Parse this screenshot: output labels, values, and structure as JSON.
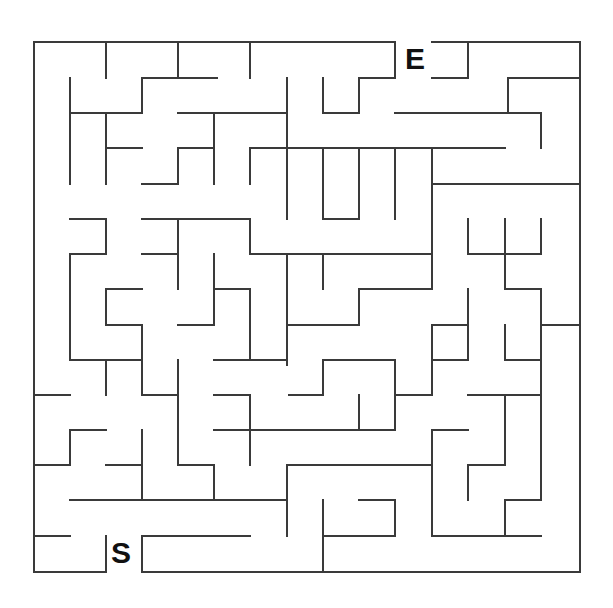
{
  "maze": {
    "start_label": "S",
    "end_label": "E",
    "wall_color": "#3a3a3a",
    "background": "#ffffff",
    "grid": {
      "xs": [
        34,
        70,
        106,
        142,
        178,
        214,
        250,
        287,
        323,
        359,
        395,
        432,
        468,
        505,
        541,
        580
      ],
      "ys": [
        42,
        78,
        113,
        148,
        184,
        219,
        254,
        289,
        325,
        360,
        395,
        430,
        465,
        500,
        536,
        572
      ]
    },
    "walls": [
      [
        34,
        42,
        395,
        42
      ],
      [
        432,
        42,
        580,
        42
      ],
      [
        580,
        42,
        580,
        572
      ],
      [
        142,
        572,
        580,
        572
      ],
      [
        34,
        572,
        106,
        572
      ],
      [
        34,
        42,
        34,
        572
      ],
      [
        106,
        42,
        106,
        78
      ],
      [
        178,
        42,
        178,
        78
      ],
      [
        250,
        42,
        250,
        78
      ],
      [
        395,
        42,
        395,
        78
      ],
      [
        142,
        78,
        217,
        78
      ],
      [
        142,
        78,
        142,
        113
      ],
      [
        70,
        78,
        70,
        184
      ],
      [
        70,
        113,
        142,
        113
      ],
      [
        287,
        78,
        287,
        219
      ],
      [
        359,
        78,
        395,
        78
      ],
      [
        359,
        78,
        359,
        113
      ],
      [
        323,
        78,
        323,
        113
      ],
      [
        323,
        113,
        359,
        113
      ],
      [
        432,
        78,
        468,
        78
      ],
      [
        468,
        42,
        468,
        78
      ],
      [
        508,
        78,
        580,
        78
      ],
      [
        508,
        78,
        508,
        113
      ],
      [
        178,
        113,
        287,
        113
      ],
      [
        214,
        113,
        214,
        184
      ],
      [
        106,
        113,
        106,
        184
      ],
      [
        106,
        148,
        142,
        148
      ],
      [
        142,
        184,
        178,
        184
      ],
      [
        178,
        148,
        178,
        184
      ],
      [
        178,
        148,
        214,
        148
      ],
      [
        395,
        113,
        541,
        113
      ],
      [
        541,
        113,
        541,
        148
      ],
      [
        250,
        148,
        505,
        148
      ],
      [
        250,
        148,
        250,
        184
      ],
      [
        323,
        148,
        323,
        219
      ],
      [
        359,
        148,
        359,
        219
      ],
      [
        395,
        148,
        395,
        219
      ],
      [
        432,
        148,
        432,
        289
      ],
      [
        323,
        219,
        359,
        219
      ],
      [
        432,
        184,
        580,
        184
      ],
      [
        70,
        219,
        106,
        219
      ],
      [
        106,
        219,
        106,
        254
      ],
      [
        70,
        254,
        106,
        254
      ],
      [
        70,
        254,
        70,
        360
      ],
      [
        70,
        360,
        142,
        360
      ],
      [
        142,
        219,
        250,
        219
      ],
      [
        178,
        219,
        178,
        289
      ],
      [
        142,
        254,
        178,
        254
      ],
      [
        250,
        219,
        250,
        254
      ],
      [
        250,
        254,
        432,
        254
      ],
      [
        214,
        254,
        214,
        325
      ],
      [
        214,
        289,
        250,
        289
      ],
      [
        250,
        289,
        250,
        360
      ],
      [
        250,
        360,
        287,
        360
      ],
      [
        287,
        254,
        287,
        360
      ],
      [
        323,
        254,
        323,
        289
      ],
      [
        359,
        289,
        432,
        289
      ],
      [
        359,
        289,
        359,
        325
      ],
      [
        287,
        325,
        359,
        325
      ],
      [
        106,
        289,
        142,
        289
      ],
      [
        106,
        289,
        106,
        325
      ],
      [
        106,
        325,
        142,
        325
      ],
      [
        142,
        325,
        142,
        395
      ],
      [
        178,
        325,
        214,
        325
      ],
      [
        468,
        219,
        468,
        254
      ],
      [
        505,
        219,
        505,
        289
      ],
      [
        541,
        219,
        541,
        254
      ],
      [
        468,
        254,
        541,
        254
      ],
      [
        505,
        289,
        541,
        289
      ],
      [
        541,
        289,
        541,
        395
      ],
      [
        541,
        325,
        580,
        325
      ],
      [
        468,
        289,
        468,
        360
      ],
      [
        432,
        325,
        468,
        325
      ],
      [
        432,
        360,
        468,
        360
      ],
      [
        432,
        325,
        432,
        395
      ],
      [
        505,
        325,
        505,
        360
      ],
      [
        505,
        360,
        541,
        360
      ],
      [
        106,
        360,
        106,
        395
      ],
      [
        178,
        360,
        178,
        465
      ],
      [
        214,
        360,
        287,
        360
      ],
      [
        287,
        360,
        287,
        365
      ],
      [
        323,
        360,
        395,
        360
      ],
      [
        323,
        360,
        323,
        395
      ],
      [
        289,
        395,
        323,
        395
      ],
      [
        395,
        360,
        395,
        395
      ],
      [
        395,
        395,
        432,
        395
      ],
      [
        34,
        395,
        70,
        395
      ],
      [
        142,
        395,
        178,
        395
      ],
      [
        214,
        395,
        250,
        395
      ],
      [
        250,
        395,
        250,
        465
      ],
      [
        359,
        395,
        359,
        430
      ],
      [
        214,
        430,
        395,
        430
      ],
      [
        395,
        395,
        395,
        430
      ],
      [
        468,
        395,
        541,
        395
      ],
      [
        505,
        395,
        505,
        465
      ],
      [
        468,
        465,
        505,
        465
      ],
      [
        468,
        465,
        468,
        500
      ],
      [
        70,
        430,
        106,
        430
      ],
      [
        70,
        430,
        70,
        465
      ],
      [
        34,
        465,
        70,
        465
      ],
      [
        106,
        465,
        142,
        465
      ],
      [
        142,
        430,
        142,
        500
      ],
      [
        178,
        465,
        214,
        465
      ],
      [
        214,
        465,
        214,
        500
      ],
      [
        287,
        465,
        432,
        465
      ],
      [
        287,
        465,
        287,
        536
      ],
      [
        432,
        430,
        468,
        430
      ],
      [
        432,
        430,
        432,
        536
      ],
      [
        70,
        500,
        287,
        500
      ],
      [
        323,
        500,
        323,
        572
      ],
      [
        359,
        500,
        395,
        500
      ],
      [
        395,
        500,
        395,
        536
      ],
      [
        323,
        536,
        395,
        536
      ],
      [
        505,
        500,
        541,
        500
      ],
      [
        505,
        500,
        505,
        536
      ],
      [
        432,
        536,
        541,
        536
      ],
      [
        541,
        395,
        541,
        500
      ],
      [
        34,
        536,
        70,
        536
      ],
      [
        106,
        536,
        106,
        572
      ],
      [
        142,
        536,
        250,
        536
      ],
      [
        142,
        536,
        142,
        572
      ]
    ]
  }
}
